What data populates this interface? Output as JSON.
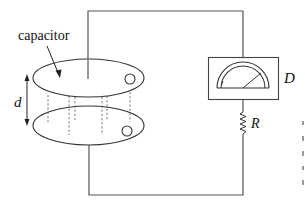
{
  "diagram": {
    "type": "circuit",
    "labels": {
      "capacitor": "capacitor",
      "separation": "d",
      "detector": "D",
      "resistor": "R"
    },
    "components": [
      {
        "id": "capacitor",
        "kind": "parallel-plate capacitor with two elliptical plates"
      },
      {
        "id": "detector",
        "kind": "analog meter (galvanometer)"
      },
      {
        "id": "resistor",
        "kind": "resistor"
      }
    ],
    "connections": [
      [
        "capacitor.top-plate",
        "detector"
      ],
      [
        "detector",
        "resistor"
      ],
      [
        "resistor",
        "capacitor.bottom-plate"
      ]
    ]
  }
}
